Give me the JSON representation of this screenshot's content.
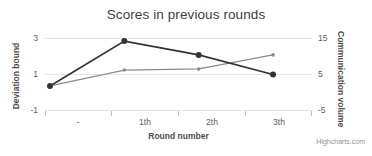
{
  "title": "Scores in previous rounds",
  "credits": "Highcharts.com",
  "axes": {
    "x": {
      "title": "Round number",
      "categories": [
        "-",
        "1th",
        "2th",
        "3th"
      ]
    },
    "y_left": {
      "title": "Deviation bound",
      "ticks": [
        "3",
        "1",
        "-1"
      ]
    },
    "y_right": {
      "title": "Communication volume",
      "ticks": [
        "15",
        "5",
        "-5"
      ]
    }
  },
  "colors": {
    "series_deviation": "#333333",
    "series_communication": "#8A8A8A",
    "gridline": "#E6E6E6",
    "axis_line": "#C0C0C0",
    "title_text": "#3E3E3E",
    "tick_text": "#606060"
  },
  "chart_data": {
    "type": "line",
    "title": "Scores in previous rounds",
    "xlabel": "Round number",
    "ylabel": "Deviation bound",
    "y2label": "Communication volume",
    "categories": [
      "-",
      "1th",
      "2th",
      "3th"
    ],
    "ylim": [
      -1,
      3
    ],
    "y2lim": [
      -5,
      15
    ],
    "grid": true,
    "legend": false,
    "series": [
      {
        "name": "Deviation bound",
        "axis": "left",
        "color": "#333333",
        "marker": "circle",
        "values": [
          0.33,
          2.83,
          2.06,
          0.97
        ]
      },
      {
        "name": "Communication volume",
        "axis": "right",
        "color": "#8A8A8A",
        "marker": "small-circle",
        "values": [
          1.7,
          6.1,
          6.4,
          10.3
        ]
      }
    ]
  }
}
